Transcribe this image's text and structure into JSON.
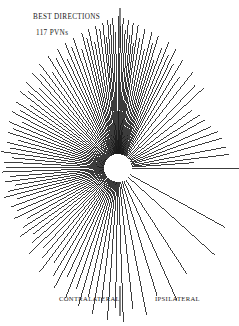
{
  "figure": {
    "title": "BEST DIRECTIONS",
    "subtitle": "117 PVNs",
    "left_axis_label": "CONTRALATERAL",
    "right_axis_label": "IPSILATERAL",
    "ink_color": "#1a1a1a",
    "background_color": "#ffffff"
  },
  "chart_data": {
    "type": "scatter",
    "plot_style": "polar-ray-plot",
    "title": "BEST DIRECTIONS",
    "subtitle": "117 PVNs",
    "xlabel": "",
    "ylabel": "",
    "n_units": 117,
    "legend": [],
    "grid": false,
    "axis_lines": {
      "description": "vertical reference line through the pole, drawn above and below the ray fan",
      "top_segment": {
        "x": 120,
        "y_start": 8,
        "y_end": 48
      },
      "bottom_segment": {
        "x": 120,
        "y_start": 286,
        "y_end": 316
      }
    },
    "quadrant_labels": {
      "left": "CONTRALATERAL",
      "right": "IPSILATERAL"
    },
    "center": {
      "x": 118,
      "y": 168
    },
    "inner_radius": 14,
    "angle_convention": "degrees, 0 = right (ipsilateral horizontal), increasing counter-clockwise",
    "rays": [
      {
        "angle": 0,
        "length": 110
      },
      {
        "angle": 4,
        "length": 62
      },
      {
        "angle": 7,
        "length": 98
      },
      {
        "angle": 11,
        "length": 96
      },
      {
        "angle": 16,
        "length": 94
      },
      {
        "angle": 20,
        "length": 92
      },
      {
        "angle": 24,
        "length": 88
      },
      {
        "angle": 29,
        "length": 86
      },
      {
        "angle": 33,
        "length": 84
      },
      {
        "angle": 38,
        "length": 80
      },
      {
        "angle": 43,
        "length": 104
      },
      {
        "angle": 47,
        "length": 100
      },
      {
        "angle": 52,
        "length": 108
      },
      {
        "angle": 56,
        "length": 96
      },
      {
        "angle": 59,
        "length": 112
      },
      {
        "angle": 62,
        "length": 104
      },
      {
        "angle": 64,
        "length": 118
      },
      {
        "angle": 66,
        "length": 110
      },
      {
        "angle": 68,
        "length": 122
      },
      {
        "angle": 70,
        "length": 114
      },
      {
        "angle": 71.5,
        "length": 100
      },
      {
        "angle": 73,
        "length": 124
      },
      {
        "angle": 74.5,
        "length": 116
      },
      {
        "angle": 76,
        "length": 126
      },
      {
        "angle": 77.5,
        "length": 108
      },
      {
        "angle": 79,
        "length": 128
      },
      {
        "angle": 80.5,
        "length": 118
      },
      {
        "angle": 82,
        "length": 130
      },
      {
        "angle": 83,
        "length": 112
      },
      {
        "angle": 84,
        "length": 132
      },
      {
        "angle": 85,
        "length": 120
      },
      {
        "angle": 86,
        "length": 134
      },
      {
        "angle": 87,
        "length": 124
      },
      {
        "angle": 88,
        "length": 136
      },
      {
        "angle": 89,
        "length": 128
      },
      {
        "angle": 90,
        "length": 138
      },
      {
        "angle": 91,
        "length": 122
      },
      {
        "angle": 92,
        "length": 136
      },
      {
        "angle": 93,
        "length": 130
      },
      {
        "angle": 94,
        "length": 134
      },
      {
        "angle": 95,
        "length": 118
      },
      {
        "angle": 96,
        "length": 132
      },
      {
        "angle": 97.5,
        "length": 126
      },
      {
        "angle": 99,
        "length": 130
      },
      {
        "angle": 100.5,
        "length": 114
      },
      {
        "angle": 102,
        "length": 128
      },
      {
        "angle": 103.5,
        "length": 120
      },
      {
        "angle": 105,
        "length": 126
      },
      {
        "angle": 107,
        "length": 110
      },
      {
        "angle": 109,
        "length": 124
      },
      {
        "angle": 111,
        "length": 116
      },
      {
        "angle": 113,
        "length": 122
      },
      {
        "angle": 115,
        "length": 106
      },
      {
        "angle": 117,
        "length": 120
      },
      {
        "angle": 119.5,
        "length": 112
      },
      {
        "angle": 122,
        "length": 118
      },
      {
        "angle": 124.5,
        "length": 102
      },
      {
        "angle": 127,
        "length": 116
      },
      {
        "angle": 129.5,
        "length": 108
      },
      {
        "angle": 132,
        "length": 114
      },
      {
        "angle": 134.5,
        "length": 98
      },
      {
        "angle": 137,
        "length": 112
      },
      {
        "angle": 139.5,
        "length": 104
      },
      {
        "angle": 142,
        "length": 110
      },
      {
        "angle": 144.5,
        "length": 94
      },
      {
        "angle": 147,
        "length": 108
      },
      {
        "angle": 149.5,
        "length": 100
      },
      {
        "angle": 152,
        "length": 106
      },
      {
        "angle": 154.5,
        "length": 92
      },
      {
        "angle": 157,
        "length": 104
      },
      {
        "angle": 159.5,
        "length": 98
      },
      {
        "angle": 162,
        "length": 102
      },
      {
        "angle": 164.5,
        "length": 90
      },
      {
        "angle": 167,
        "length": 100
      },
      {
        "angle": 169.5,
        "length": 96
      },
      {
        "angle": 172,
        "length": 104
      },
      {
        "angle": 174.5,
        "length": 92
      },
      {
        "angle": 177,
        "length": 100
      },
      {
        "angle": 179.5,
        "length": 98
      },
      {
        "angle": 182,
        "length": 102
      },
      {
        "angle": 184.5,
        "length": 94
      },
      {
        "angle": 187,
        "length": 100
      },
      {
        "angle": 189.5,
        "length": 90
      },
      {
        "angle": 192,
        "length": 98
      },
      {
        "angle": 194.5,
        "length": 104
      },
      {
        "angle": 197,
        "length": 92
      },
      {
        "angle": 200,
        "length": 100
      },
      {
        "angle": 203,
        "length": 96
      },
      {
        "angle": 206,
        "length": 102
      },
      {
        "angle": 209,
        "length": 90
      },
      {
        "angle": 212,
        "length": 98
      },
      {
        "angle": 215,
        "length": 106
      },
      {
        "angle": 218,
        "length": 94
      },
      {
        "angle": 221,
        "length": 100
      },
      {
        "angle": 224,
        "length": 110
      },
      {
        "angle": 227,
        "length": 96
      },
      {
        "angle": 230,
        "length": 104
      },
      {
        "angle": 233,
        "length": 116
      },
      {
        "angle": 236,
        "length": 100
      },
      {
        "angle": 239,
        "length": 112
      },
      {
        "angle": 242,
        "length": 122
      },
      {
        "angle": 245,
        "length": 106
      },
      {
        "angle": 248,
        "length": 126
      },
      {
        "angle": 251,
        "length": 114
      },
      {
        "angle": 254,
        "length": 130
      },
      {
        "angle": 257,
        "length": 118
      },
      {
        "angle": 260,
        "length": 134
      },
      {
        "angle": 263,
        "length": 122
      },
      {
        "angle": 266,
        "length": 138
      },
      {
        "angle": 269,
        "length": 126
      },
      {
        "angle": 272,
        "length": 140
      },
      {
        "angle": 276,
        "length": 128
      },
      {
        "angle": 281,
        "length": 136
      },
      {
        "angle": 287,
        "length": 120
      },
      {
        "angle": 294,
        "length": 130
      },
      {
        "angle": 303,
        "length": 112
      },
      {
        "angle": 318,
        "length": 116
      },
      {
        "angle": 331,
        "length": 108
      }
    ]
  }
}
